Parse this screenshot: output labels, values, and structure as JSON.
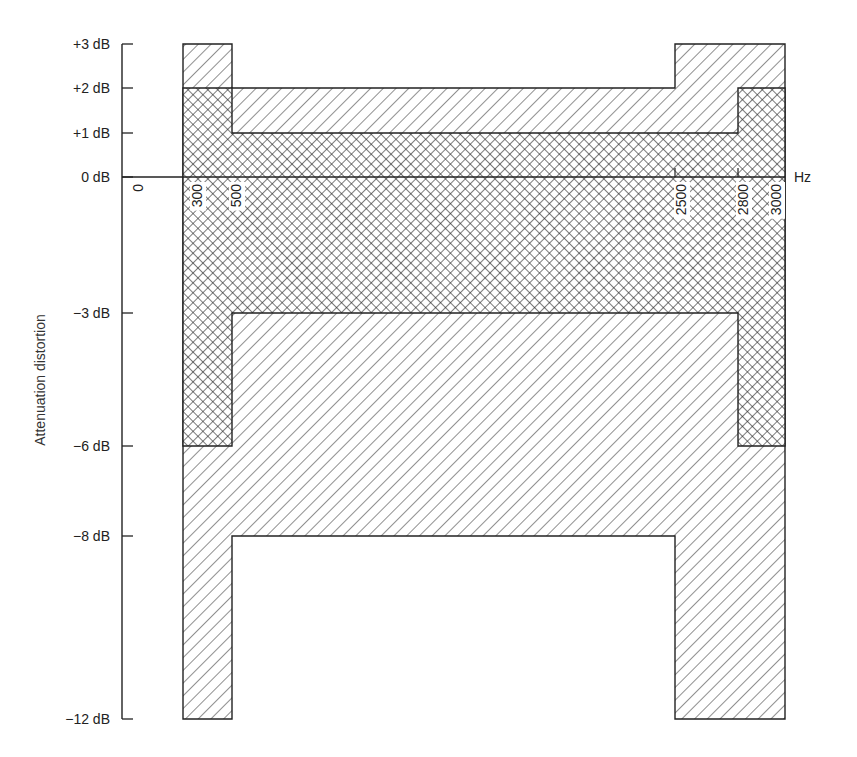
{
  "chart_data": {
    "type": "area",
    "title": "",
    "xlabel": "Hz",
    "ylabel": "Attenuation distortion",
    "y_ticks": [
      "+3 dB",
      "+2 dB",
      "+1 dB",
      "0 dB",
      "-3 dB",
      "-6 dB",
      "-8 dB",
      "-12 dB"
    ],
    "y_tick_values": [
      3,
      2,
      1,
      0,
      -3,
      -6,
      -8,
      -12
    ],
    "x_ticks": [
      "0",
      "300",
      "500",
      "2500",
      "2800",
      "3000"
    ],
    "x_tick_values": [
      0,
      300,
      500,
      2500,
      2800,
      3000
    ],
    "ylim": [
      -12,
      3
    ],
    "grid": false,
    "legend": null,
    "series": [
      {
        "name": "Single-hatched mask (wider tolerance)",
        "pattern": "single-hatch",
        "upper_limit": [
          {
            "x_from": 300,
            "x_to": 500,
            "db": 3
          },
          {
            "x_from": 500,
            "x_to": 2500,
            "db": 2
          },
          {
            "x_from": 2500,
            "x_to": 3000,
            "db": 3
          }
        ],
        "lower_limit": [
          {
            "x_from": 300,
            "x_to": 500,
            "db": -12
          },
          {
            "x_from": 500,
            "x_to": 2500,
            "db": -8
          },
          {
            "x_from": 2500,
            "x_to": 3000,
            "db": -12
          }
        ]
      },
      {
        "name": "Cross-hatched mask (tighter tolerance)",
        "pattern": "cross-hatch",
        "upper_limit": [
          {
            "x_from": 300,
            "x_to": 500,
            "db": 2
          },
          {
            "x_from": 500,
            "x_to": 2800,
            "db": 1
          },
          {
            "x_from": 2800,
            "x_to": 3000,
            "db": 2
          }
        ],
        "lower_limit": [
          {
            "x_from": 300,
            "x_to": 500,
            "db": -6
          },
          {
            "x_from": 500,
            "x_to": 2800,
            "db": -3
          },
          {
            "x_from": 2800,
            "x_to": 3000,
            "db": -6
          }
        ]
      }
    ]
  },
  "colors": {
    "line": "#222222",
    "background": "#ffffff"
  }
}
